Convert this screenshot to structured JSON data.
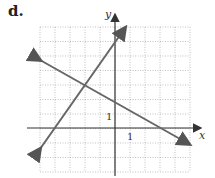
{
  "label": "d.",
  "chart_data": {
    "type": "line",
    "title": "",
    "xlabel": "x",
    "ylabel": "y",
    "tick_labels": {
      "x": "1",
      "y": "1"
    },
    "xlim": [
      -5,
      5
    ],
    "ylim": [
      -3,
      7
    ],
    "grid": true,
    "series": [
      {
        "name": "line-1",
        "equation": "y = 1.5x + 6",
        "points": [
          [
            -5,
            -1.5
          ],
          [
            0.7,
            7
          ]
        ]
      },
      {
        "name": "line-2",
        "equation": "y = -2/3x + 2",
        "points": [
          [
            -5,
            5.33
          ],
          [
            5,
            -1.33
          ]
        ]
      }
    ],
    "intersection": [
      -1.85,
      3.23
    ]
  }
}
